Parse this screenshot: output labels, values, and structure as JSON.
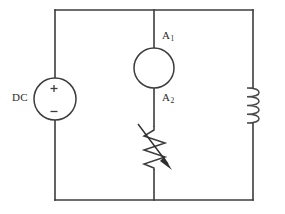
{
  "figure": {
    "background_color": "#ffffff",
    "line_color": "#3c3c3c",
    "width": 285,
    "height": 214
  },
  "labels": {
    "dc_source": "DC",
    "ammeter_top": "A",
    "ammeter_top_subscript": "1",
    "ammeter_bottom": "A",
    "ammeter_bottom_subscript": "2",
    "plus_sign": "+",
    "minus_sign": "−"
  },
  "components": [
    {
      "id": "dc-source",
      "type": "voltage-source",
      "symbol": "circle-with-plus-minus",
      "label": "DC",
      "branch": "left",
      "center": [
        55,
        99
      ],
      "radius": 21,
      "polarity_top": "+",
      "polarity_bottom": "−"
    },
    {
      "id": "ammeter-a1",
      "type": "ammeter",
      "symbol": "circle",
      "label": "A1",
      "branch": "middle",
      "center": [
        154,
        68
      ],
      "radius": 20
    },
    {
      "id": "node-a2",
      "type": "node-label",
      "label": "A2",
      "branch": "middle",
      "position": [
        154,
        99
      ]
    },
    {
      "id": "rheostat",
      "type": "variable-resistor",
      "symbol": "zigzag-with-diagonal-arrow",
      "branch": "middle",
      "span_y": [
        126,
        170
      ]
    },
    {
      "id": "inductor",
      "type": "inductor",
      "symbol": "four-loop-coil",
      "branch": "right",
      "span_y": [
        88,
        123
      ],
      "loops": 4
    }
  ],
  "wires": {
    "left_rail_x": 55,
    "middle_branch_x": 154,
    "right_rail_x": 253,
    "top_rail_y": 10,
    "bottom_rail_y": 200
  }
}
